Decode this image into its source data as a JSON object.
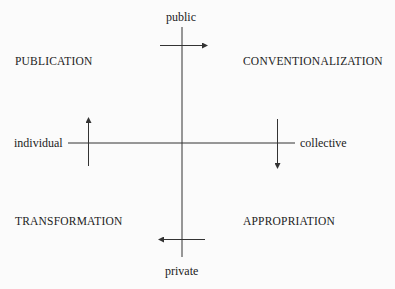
{
  "diagram": {
    "type": "two-axis quadrant diagram",
    "axes": {
      "vertical": {
        "top": "public",
        "bottom": "private"
      },
      "horizontal": {
        "left": "individual",
        "right": "collective"
      }
    },
    "quadrants": {
      "top_left": "PUBLICATION",
      "top_right": "CONVENTIONALIZATION",
      "bottom_left": "TRANSFORMATION",
      "bottom_right": "APPROPRIATION"
    },
    "arrows": [
      {
        "position": "top",
        "direction": "right"
      },
      {
        "position": "right",
        "direction": "down"
      },
      {
        "position": "bottom",
        "direction": "left"
      },
      {
        "position": "left",
        "direction": "up"
      }
    ],
    "colors": {
      "line": "#333333",
      "text": "#222222",
      "background": "#fbfbfb"
    }
  }
}
